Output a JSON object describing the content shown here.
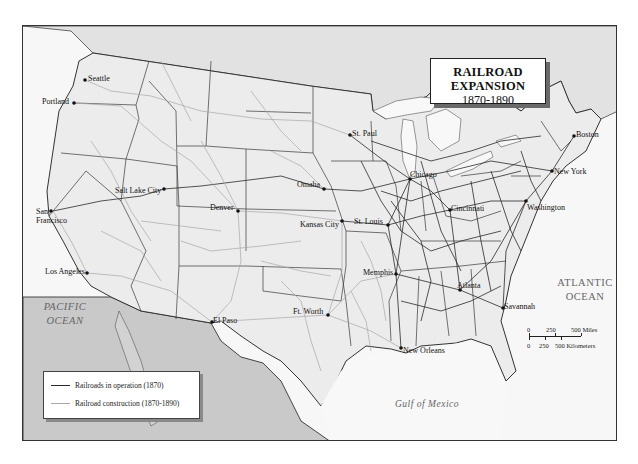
{
  "title": {
    "line1": "RAILROAD EXPANSION",
    "line2": "1870-1890"
  },
  "legend": {
    "items": [
      {
        "label": "Railroads in operation (1870)",
        "color": "#2a2a2a"
      },
      {
        "label": "Railroad construction (1870-1890)",
        "color": "#a8a8a8"
      }
    ]
  },
  "water_labels": {
    "pacific_line1": "PACIFIC",
    "pacific_line2": "OCEAN",
    "atlantic_line1": "ATLANTIC",
    "atlantic_line2": "OCEAN",
    "gulf": "Gulf of Mexico"
  },
  "cities": [
    {
      "name": "Seattle",
      "x": 84,
      "y": 79
    },
    {
      "name": "Portland",
      "x": 73,
      "y": 102
    },
    {
      "name": "San Francisco",
      "x": 50,
      "y": 210
    },
    {
      "name": "Los Angeles",
      "x": 86,
      "y": 272
    },
    {
      "name": "Salt Lake City",
      "x": 163,
      "y": 188
    },
    {
      "name": "Denver",
      "x": 237,
      "y": 210
    },
    {
      "name": "El Paso",
      "x": 211,
      "y": 321
    },
    {
      "name": "Ft. Worth",
      "x": 327,
      "y": 314
    },
    {
      "name": "Omaha",
      "x": 323,
      "y": 188
    },
    {
      "name": "Kansas City",
      "x": 341,
      "y": 220
    },
    {
      "name": "St. Paul",
      "x": 349,
      "y": 134
    },
    {
      "name": "Chicago",
      "x": 409,
      "y": 178
    },
    {
      "name": "St. Louis",
      "x": 387,
      "y": 224
    },
    {
      "name": "Cincinnati",
      "x": 449,
      "y": 209
    },
    {
      "name": "Memphis",
      "x": 395,
      "y": 273
    },
    {
      "name": "Atlanta",
      "x": 459,
      "y": 289
    },
    {
      "name": "Savannah",
      "x": 502,
      "y": 307
    },
    {
      "name": "New Orleans",
      "x": 400,
      "y": 347
    },
    {
      "name": "Washington",
      "x": 525,
      "y": 200
    },
    {
      "name": "New York",
      "x": 551,
      "y": 170
    },
    {
      "name": "Boston",
      "x": 573,
      "y": 135
    }
  ],
  "scale": {
    "miles_ticks": [
      "0",
      "250",
      "500 Miles"
    ],
    "km_ticks": [
      "0",
      "250",
      "500 Kilometers"
    ]
  },
  "colors": {
    "land": "#ececec",
    "foreign_land": "#c9c9c9",
    "water": "#f8f8f8",
    "border": "#333333"
  }
}
